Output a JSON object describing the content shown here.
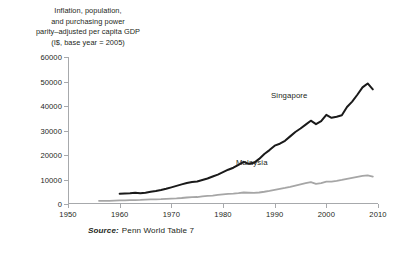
{
  "title": {
    "lines": [
      "Inflation, population,",
      "and purchasing power",
      "parity–adjusted per capita GDP",
      "(I$, base year = 2005)"
    ]
  },
  "source": {
    "label": "Source:",
    "text": "Penn World Table 7"
  },
  "colors": {
    "singapore": "#1a1a1a",
    "malaysia": "#a6a6a6",
    "axis": "#a7a9ac",
    "text": "#231f20",
    "background": "#ffffff"
  },
  "chart_data": {
    "type": "line",
    "title": "Inflation, population, and purchasing power parity–adjusted per capita GDP (I$, base year = 2005)",
    "subtitle": "",
    "xlabel": "",
    "ylabel": "",
    "xlim": [
      1950,
      2010
    ],
    "ylim": [
      0,
      60000
    ],
    "xticks": [
      1950,
      1960,
      1970,
      1980,
      1990,
      2000,
      2010
    ],
    "yticks": [
      0,
      10000,
      20000,
      30000,
      40000,
      50000,
      60000
    ],
    "xticklabels": [
      "1950",
      "1960",
      "1970",
      "1980",
      "1990",
      "2000",
      "2010"
    ],
    "yticklabels": [
      "0",
      "10000",
      "20000",
      "30000",
      "40000",
      "50000",
      "60000"
    ],
    "grid": false,
    "legend": "inline-annotation",
    "source": "Penn World Table 7",
    "series": [
      {
        "name": "Singapore",
        "color": "#1a1a1a",
        "x": [
          1960,
          1961,
          1962,
          1963,
          1964,
          1965,
          1966,
          1967,
          1968,
          1969,
          1970,
          1971,
          1972,
          1973,
          1974,
          1975,
          1976,
          1977,
          1978,
          1979,
          1980,
          1981,
          1982,
          1983,
          1984,
          1985,
          1986,
          1987,
          1988,
          1989,
          1990,
          1991,
          1992,
          1993,
          1994,
          1995,
          1996,
          1997,
          1998,
          1999,
          2000,
          2001,
          2002,
          2003,
          2004,
          2005,
          2006,
          2007,
          2008,
          2009
        ],
        "values": [
          4200,
          4300,
          4400,
          4600,
          4400,
          4600,
          5000,
          5300,
          5700,
          6200,
          6800,
          7400,
          8000,
          8600,
          9000,
          9200,
          9800,
          10400,
          11200,
          12000,
          13000,
          14000,
          14800,
          16000,
          17200,
          16400,
          16800,
          18400,
          20400,
          22000,
          23800,
          24600,
          25800,
          27600,
          29400,
          30800,
          32400,
          34000,
          32600,
          33800,
          36400,
          35200,
          35600,
          36200,
          39600,
          41800,
          44600,
          47600,
          49200,
          46800
        ],
        "marker": "none",
        "linewidth": 2.0,
        "label_position": {
          "x": 2001,
          "y": 51500
        }
      },
      {
        "name": "Malaysia",
        "color": "#a6a6a6",
        "x": [
          1956,
          1957,
          1958,
          1959,
          1960,
          1961,
          1962,
          1963,
          1964,
          1965,
          1966,
          1967,
          1968,
          1969,
          1970,
          1971,
          1972,
          1973,
          1974,
          1975,
          1976,
          1977,
          1978,
          1979,
          1980,
          1981,
          1982,
          1983,
          1984,
          1985,
          1986,
          1987,
          1988,
          1989,
          1990,
          1991,
          1992,
          1993,
          1994,
          1995,
          1996,
          1997,
          1998,
          1999,
          2000,
          2001,
          2002,
          2003,
          2004,
          2005,
          2006,
          2007,
          2008,
          2009
        ],
        "values": [
          1300,
          1300,
          1300,
          1400,
          1450,
          1500,
          1550,
          1600,
          1650,
          1750,
          1850,
          1900,
          1950,
          2100,
          2200,
          2300,
          2450,
          2650,
          2800,
          2850,
          3100,
          3300,
          3450,
          3700,
          3900,
          4100,
          4250,
          4450,
          4700,
          4600,
          4500,
          4700,
          5000,
          5350,
          5750,
          6150,
          6550,
          7000,
          7500,
          8000,
          8500,
          8900,
          8200,
          8500,
          9100,
          9100,
          9400,
          9800,
          10300,
          10700,
          11100,
          11500,
          11700,
          11200
        ],
        "marker": "none",
        "linewidth": 1.8,
        "label_position": {
          "x": 1990,
          "y": 14200
        }
      }
    ]
  }
}
